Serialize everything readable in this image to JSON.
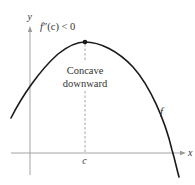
{
  "figure": {
    "type": "concavity-diagram",
    "axes": {
      "x_label": "x",
      "y_label": "y",
      "color": "#9a9a9a"
    },
    "curve": {
      "label": "f",
      "color": "#1a1a1a",
      "shape": "concave downward parabola-like curve"
    },
    "critical_point": {
      "x_label": "c",
      "marker_color": "#1a1a1a"
    },
    "annotations": {
      "condition_f": "f",
      "condition_primes": "″",
      "condition_arg": "(c) < 0",
      "description_line1": "Concave",
      "description_line2": "downward"
    }
  }
}
